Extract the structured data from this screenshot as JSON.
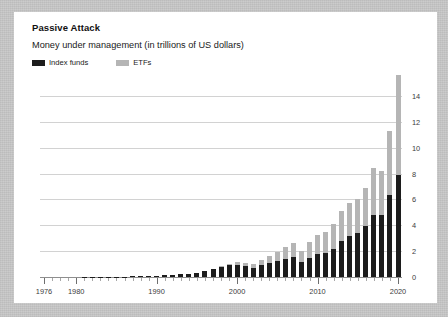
{
  "card": {
    "title": "Passive Attack",
    "subtitle": "Money under management (in trillions of US dollars)"
  },
  "legend": {
    "position": "top-left",
    "items": [
      {
        "label": "Index funds",
        "color": "#1c1c1c",
        "swatch_name": "legend-swatch-index-funds"
      },
      {
        "label": "ETFs",
        "color": "#b5b5b5",
        "swatch_name": "legend-swatch-etfs"
      }
    ]
  },
  "colors": {
    "index_funds": "#1c1c1c",
    "etfs": "#b5b5b5",
    "gridline": "#d2d2d2",
    "axis": "#8e8e8e",
    "card_background": "#ffffff",
    "page_background": "#c9c9c9",
    "text": "#1a1a1a"
  },
  "chart_data": {
    "type": "bar",
    "subtype": "stacked-bar",
    "title": "Passive Attack",
    "subtitle": "Money under management (in trillions of US dollars)",
    "xlabel": "",
    "ylabel": "",
    "ylim": [
      0,
      16
    ],
    "yticks": [
      0,
      2,
      4,
      6,
      8,
      10,
      12,
      14
    ],
    "ytick_labels": [
      "0",
      "2",
      "4",
      "6",
      "8",
      "10",
      "12",
      "14"
    ],
    "y_axis_position": "right",
    "grid": true,
    "grid_axis": "y",
    "legend_position": "top-left",
    "x": [
      1976,
      1977,
      1978,
      1979,
      1980,
      1981,
      1982,
      1983,
      1984,
      1985,
      1986,
      1987,
      1988,
      1989,
      1990,
      1991,
      1992,
      1993,
      1994,
      1995,
      1996,
      1997,
      1998,
      1999,
      2000,
      2001,
      2002,
      2003,
      2004,
      2005,
      2006,
      2007,
      2008,
      2009,
      2010,
      2011,
      2012,
      2013,
      2014,
      2015,
      2016,
      2017,
      2018,
      2019,
      2020
    ],
    "xtick_labels": [
      "1976",
      "1980",
      "1990",
      "2000",
      "2010",
      "2020"
    ],
    "xticks": [
      1976,
      1980,
      1990,
      2000,
      2010,
      2020
    ],
    "series": [
      {
        "name": "Index funds",
        "color": "#1c1c1c",
        "values": [
          0.0,
          0.0,
          0.0,
          0.0,
          0.0,
          0.01,
          0.01,
          0.02,
          0.02,
          0.03,
          0.04,
          0.05,
          0.06,
          0.08,
          0.09,
          0.12,
          0.15,
          0.2,
          0.25,
          0.33,
          0.45,
          0.6,
          0.75,
          0.9,
          0.95,
          0.85,
          0.7,
          0.9,
          1.05,
          1.2,
          1.4,
          1.55,
          1.15,
          1.5,
          1.75,
          1.85,
          2.2,
          2.8,
          3.2,
          3.4,
          3.9,
          4.8,
          4.8,
          6.3,
          7.9
        ]
      },
      {
        "name": "ETFs",
        "color": "#b5b5b5",
        "values": [
          0.0,
          0.0,
          0.0,
          0.0,
          0.0,
          0.0,
          0.0,
          0.0,
          0.0,
          0.0,
          0.0,
          0.0,
          0.0,
          0.0,
          0.0,
          0.0,
          0.0,
          0.01,
          0.01,
          0.02,
          0.03,
          0.05,
          0.08,
          0.12,
          0.2,
          0.25,
          0.3,
          0.45,
          0.6,
          0.75,
          0.95,
          1.1,
          0.85,
          1.2,
          1.5,
          1.6,
          1.9,
          2.3,
          2.5,
          2.6,
          3.0,
          3.6,
          3.4,
          5.0,
          7.7
        ]
      }
    ],
    "totals": [
      0.0,
      0.0,
      0.0,
      0.0,
      0.0,
      0.01,
      0.01,
      0.02,
      0.02,
      0.03,
      0.04,
      0.05,
      0.06,
      0.08,
      0.09,
      0.12,
      0.15,
      0.21,
      0.26,
      0.35,
      0.48,
      0.65,
      0.83,
      1.02,
      1.15,
      1.1,
      1.0,
      1.35,
      1.65,
      1.95,
      2.35,
      2.65,
      2.0,
      2.7,
      3.25,
      3.45,
      4.1,
      5.1,
      5.7,
      6.0,
      6.9,
      8.4,
      8.2,
      11.3,
      15.6
    ]
  }
}
